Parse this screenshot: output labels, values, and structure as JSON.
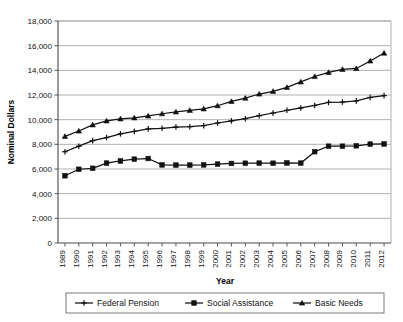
{
  "chart_data": {
    "type": "line",
    "title": "",
    "xlabel": "Year",
    "ylabel": "Nominal Dollars",
    "ylim": [
      0,
      18000
    ],
    "ytick_step": 2000,
    "grid": true,
    "legend_position": "bottom",
    "ytick_labels": [
      "0",
      "2,000",
      "4,000",
      "6,000",
      "8,000",
      "10,000",
      "12,000",
      "14,000",
      "16,000",
      "18,000"
    ],
    "yticks": [
      0,
      2000,
      4000,
      6000,
      8000,
      10000,
      12000,
      14000,
      16000,
      18000
    ],
    "categories": [
      "1989",
      "1990",
      "1991",
      "1992",
      "1993",
      "1994",
      "1995",
      "1996",
      "1997",
      "1998",
      "1999",
      "2000",
      "2001",
      "2002",
      "2003",
      "2004",
      "2005",
      "2006",
      "2007",
      "2008",
      "2009",
      "2010",
      "2011",
      "2012"
    ],
    "x": [
      1989,
      1990,
      1991,
      1992,
      1993,
      1994,
      1995,
      1996,
      1997,
      1998,
      1999,
      2000,
      2001,
      2002,
      2003,
      2004,
      2005,
      2006,
      2007,
      2008,
      2009,
      2010,
      2011,
      2012
    ],
    "series": [
      {
        "name": "Federal Pension",
        "marker": "cross",
        "values": [
          7400,
          7850,
          8300,
          8550,
          8850,
          9050,
          9250,
          9300,
          9400,
          9430,
          9520,
          9730,
          9900,
          10080,
          10320,
          10540,
          10760,
          10950,
          11150,
          11400,
          11430,
          11520,
          11800,
          11950
        ]
      },
      {
        "name": "Social Assistance",
        "marker": "square",
        "values": [
          5450,
          5980,
          6060,
          6480,
          6650,
          6800,
          6850,
          6330,
          6320,
          6320,
          6330,
          6400,
          6450,
          6470,
          6480,
          6470,
          6490,
          6480,
          7400,
          7850,
          7850,
          7880,
          8020,
          8030
        ]
      },
      {
        "name": "Basic Needs",
        "marker": "triangle",
        "values": [
          8650,
          9080,
          9580,
          9900,
          10070,
          10150,
          10300,
          10480,
          10630,
          10760,
          10880,
          11130,
          11480,
          11750,
          12080,
          12300,
          12620,
          13060,
          13500,
          13830,
          14080,
          14150,
          14760,
          15400
        ]
      }
    ]
  },
  "legend": {
    "entries": [
      {
        "label": "Federal Pension",
        "marker": "cross"
      },
      {
        "label": "Social Assistance",
        "marker": "square"
      },
      {
        "label": "Basic Needs",
        "marker": "triangle"
      }
    ]
  }
}
